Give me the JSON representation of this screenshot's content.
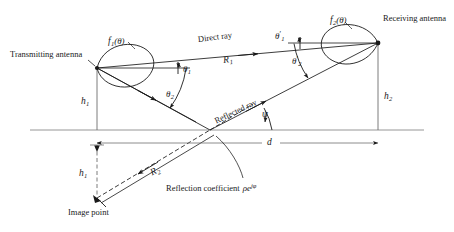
{
  "figure": {
    "background_color": "#ffffff",
    "line_color": "#1a1a1a",
    "width": 454,
    "height": 232
  },
  "labels": {
    "transmitting_antenna": "Transmitting antenna",
    "receiving_antenna": "Receiving antenna",
    "image_point": "Image point",
    "direct_ray": "Direct ray",
    "reflected_ray": "Reflected ray",
    "reflection_coefficient": "Reflection coefficient",
    "reflection_coefficient_symbol_rho": "ρ",
    "reflection_coefficient_symbol_e": "e",
    "reflection_coefficient_exponent": "jφ",
    "pattern_tx": "f",
    "pattern_tx_sub": "1",
    "pattern_tx_arg": "(θ)",
    "pattern_rx": "f",
    "pattern_rx_sub": "2",
    "pattern_rx_arg": "(θ)",
    "theta1": "θ",
    "theta1_sub": "1",
    "theta2": "θ",
    "theta2_sub": "2",
    "theta1_prime": "θ",
    "theta1_prime_sub": "1",
    "theta2_prime": "θ",
    "theta2_prime_sub": "2",
    "prime_mark": "′",
    "psi": "ψ",
    "height_tx": "h",
    "height_tx_sub": "1",
    "height_rx": "h",
    "height_rx_sub": "2",
    "height_image": "h",
    "height_image_sub": "1",
    "range_direct": "R",
    "range_direct_sub": "1",
    "range_reflected": "R",
    "range_reflected_sub": "2",
    "distance": "d"
  },
  "geometry": {
    "tx_antenna_point": [
      97,
      68
    ],
    "rx_antenna_point": [
      378,
      43
    ],
    "reflection_point": [
      210,
      130
    ],
    "image_point": [
      97,
      198
    ],
    "ground_line_y": 130,
    "dimension_line_d_y": 143,
    "dimension_line_h1_y": 145,
    "tx_height_px": 62,
    "rx_height_px": 87
  }
}
